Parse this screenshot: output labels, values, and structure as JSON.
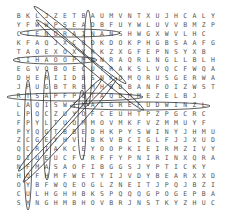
{
  "puzzle": {
    "type": "word-search",
    "rows": [
      "BKLJZETBAUMVNTXUJHCALY",
      "YFWWPSEADBFUYWLUVVBMZP",
      "CIENORAINANSHWGXWVLHC",
      "KFAQJXCODKDOKPHGBSAAFG",
      "TAOEXOXYRKZXGFEPNSYXB",
      "SIHAOOPMNNRAQRLNGLLBLH",
      "EGVOBOECUTRAKSLVQCFWQA",
      "DHERIIDBSNKOMQRUSGERWA",
      "JPUGBTRBMHBDBANFOIZWST",
      "RTSAPFPOTAQDMMEZELBJ",
      "LAQISWINAIGREFUDWINZL",
      "LPQCZUYOFCEUHTPZPGCRC",
      "FPYLTUOMMOVMKFVZMMUYF",
      "PYQGTBBEDHKPYSWINYJHMU",
      "ZCGEYHVLBKVBCIGLFJJXUD",
      "QCRIAKCEYOOPKIEIRMZIVY",
      "DIUEUCFTRFFYPNIRINXQRA",
      "NFMASAOFIBGGSJYPTICKY",
      "HOFHMFWETYIJVDYBEARXXD",
      "OYBFWQEOGLZNEITJPQJBZI",
      "CULHGHHBKSPQQQGPOGEPBA",
      "SYNGHMBHOVBRJNSTKYZHUC"
    ]
  }
}
